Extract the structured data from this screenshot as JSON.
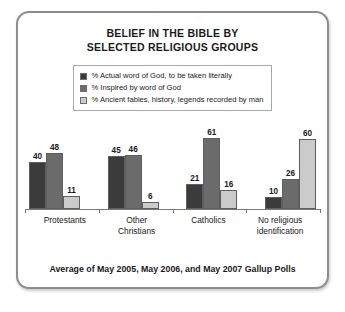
{
  "card": {
    "title_line1": "BELIEF IN THE BIBLE BY",
    "title_line2": "SELECTED RELIGIOUS GROUPS",
    "footer": "Average of May 2005, May 2006, and May 2007 Gallup Polls"
  },
  "chart_data": {
    "type": "bar",
    "title": "BELIEF IN THE BIBLE BY SELECTED RELIGIOUS GROUPS",
    "subtitle": "Average of May 2005, May 2006, and May 2007 Gallup Polls",
    "xlabel": "",
    "ylabel": "",
    "ylim": [
      0,
      65
    ],
    "grid": false,
    "legend_position": "top-center",
    "axis_visible": "x-only",
    "categories": [
      "Protestants",
      "Other Christians",
      "Catholics",
      "No religious identification"
    ],
    "category_lines": [
      [
        "Protestants"
      ],
      [
        "Other",
        "Christians"
      ],
      [
        "Catholics"
      ],
      [
        "No religious",
        "identification"
      ]
    ],
    "series": [
      {
        "name": "% Actual word of God, to be taken literally",
        "color": "#3b3b3b",
        "values": [
          40,
          45,
          21,
          10
        ]
      },
      {
        "name": "% Inspired by word of God",
        "color": "#6b6b6b",
        "values": [
          48,
          46,
          61,
          26
        ]
      },
      {
        "name": "% Ancient fables, history, legends recorded by man",
        "color": "#cbcbcb",
        "values": [
          11,
          6,
          16,
          60
        ]
      }
    ]
  }
}
